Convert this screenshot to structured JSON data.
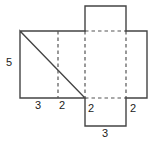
{
  "figure": {
    "name": "rectangular-prism-net",
    "width": 154,
    "height": 141,
    "background_color": "#ffffff",
    "solid_line_color": "#444444",
    "dashed_line_color": "#555555",
    "label_color": "#222222"
  },
  "labels": {
    "left_height": "5",
    "bottom_first": "3",
    "bottom_second": "2",
    "bottom_flap_left": "2",
    "bottom_right": "2",
    "bottom_flap_width": "3"
  },
  "geometry": {
    "main_rect": {
      "x1": 20,
      "y1": 31,
      "x2": 147,
      "y2": 98
    },
    "top_flap": {
      "x1": 85,
      "y1": 6,
      "x2": 126,
      "y2": 31
    },
    "bottom_flap": {
      "x1": 85,
      "y1": 98,
      "x2": 126,
      "y2": 126
    },
    "fold_lines_vertical_x": [
      58,
      85,
      126
    ],
    "fold_lines_horizontal_y": [
      31,
      98
    ]
  }
}
